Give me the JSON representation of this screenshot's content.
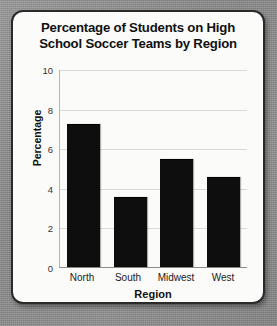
{
  "chart_data": {
    "type": "bar",
    "title": "Percentage of Students on High School Soccer Teams by Region",
    "title_line1": "Percentage of Students on High",
    "title_line2": "School Soccer Teams by Region",
    "categories": [
      "North",
      "South",
      "Midwest",
      "West"
    ],
    "values": [
      7.2,
      3.5,
      5.45,
      4.5
    ],
    "xlabel": "Region",
    "ylabel": "Percentage",
    "ylim": [
      0,
      10
    ],
    "yticks": [
      0,
      2,
      4,
      6,
      8,
      10
    ],
    "ytick_labels": [
      "0",
      "2",
      "4",
      "6",
      "8",
      "10"
    ],
    "grid": "horizontal",
    "legend": "none",
    "bar_color": "#0e0e0e",
    "gridline_color": "#d9d9d9",
    "plot_background": "#fbfbfa"
  },
  "card": {
    "background": "#fbfbfa",
    "border_color": "#2a2a2a"
  },
  "page": {
    "background": "#8e8e8e"
  }
}
